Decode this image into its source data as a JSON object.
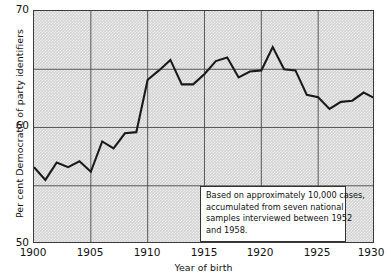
{
  "chart_data": {
    "type": "line",
    "title": "",
    "xlabel": "Year of birth",
    "ylabel": "Per cent Democratic of party identifiers",
    "xlim": [
      1900,
      1930
    ],
    "ylim": [
      50,
      70
    ],
    "xticks": [
      "1900",
      "1905",
      "1910",
      "1915",
      "1920",
      "1925",
      "1930"
    ],
    "xtick_values": [
      1900,
      1905,
      1910,
      1915,
      1920,
      1925,
      1930
    ],
    "yticks": [
      "50",
      "60",
      "70"
    ],
    "ytick_values": [
      50,
      60,
      70
    ],
    "gridlines_y": [
      55,
      60,
      65
    ],
    "gridlines_x": [
      1905,
      1910,
      1915,
      1920,
      1925
    ],
    "grid": true,
    "legend": "none",
    "x": [
      1900,
      1901,
      1902,
      1903,
      1904,
      1905,
      1906,
      1907,
      1908,
      1909,
      1910,
      1911,
      1912,
      1913,
      1914,
      1915,
      1916,
      1917,
      1918,
      1919,
      1920,
      1921,
      1922,
      1923,
      1924,
      1925,
      1926,
      1927,
      1928,
      1929,
      1930
    ],
    "values": [
      56.6,
      55.5,
      57.0,
      56.6,
      57.1,
      56.2,
      58.8,
      58.2,
      59.5,
      59.6,
      64.1,
      64.9,
      65.8,
      63.7,
      63.7,
      64.6,
      65.7,
      66.0,
      64.3,
      64.8,
      64.9,
      66.9,
      65.0,
      64.9,
      62.8,
      62.6,
      61.6,
      62.2,
      62.3,
      63.0,
      62.5
    ],
    "series_color": "#1a1a1a",
    "plot_background": "#d2d2d2"
  },
  "annotation": {
    "lines": [
      "Based on approximately 10,000 cases,",
      "accumulated from seven national",
      "samples interviewed between 1952",
      "and 1958."
    ],
    "line1": "Based on approximately 10,000 cases,",
    "line2": "accumulated from seven national",
    "line3": "samples interviewed between 1952",
    "line4": "and 1958."
  },
  "axis_titles": {
    "y": "Per cent Democratic of party identifiers",
    "x": "Year of birth"
  },
  "ytick_labels": {
    "top": "70",
    "mid": "60",
    "bottom": "50"
  },
  "xtick_labels": {
    "t0": "1900",
    "t1": "1905",
    "t2": "1910",
    "t3": "1915",
    "t4": "1920",
    "t5": "1925",
    "t6": "1930"
  }
}
